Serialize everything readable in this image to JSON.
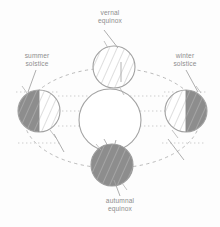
{
  "diagram": {
    "labels": {
      "vernal_equinox": {
        "line1": "vernal",
        "line2": "equinox"
      },
      "summer_solstice": {
        "line1": "summer",
        "line2": "solstice"
      },
      "winter_solstice": {
        "line1": "winter",
        "line2": "solstice"
      },
      "autumnal_equinox": {
        "line1": "autumnal",
        "line2": "equinox"
      }
    },
    "colors": {
      "stroke": "#9a9a9a",
      "shadow_fill": "#8a8a8a",
      "light_fill": "#ffffff",
      "hatch": "#b3b3b3",
      "label_text": "#8d8d8d",
      "orbit_dash": "#b0b0b0",
      "ray_dot": "#bdbdbd",
      "background": "#fdfdfd"
    },
    "sun": {
      "label": "sun",
      "cx": 110,
      "cy": 120,
      "r": 31
    },
    "earth_positions": [
      {
        "name": "vernal-equinox-earth",
        "cx": 114,
        "cy": 67,
        "r": 21,
        "shaded_side": "none",
        "description": "equinox position, terminator perpendicular to view"
      },
      {
        "name": "summer-solstice-earth",
        "cx": 39,
        "cy": 111,
        "r": 21,
        "shaded_side": "left",
        "description": "northern hemisphere tilted toward sun"
      },
      {
        "name": "winter-solstice-earth",
        "cx": 186,
        "cy": 111,
        "r": 21,
        "shaded_side": "right",
        "description": "northern hemisphere tilted away from sun"
      },
      {
        "name": "autumnal-equinox-earth",
        "cx": 112,
        "cy": 165,
        "r": 21,
        "shaded_side": "all",
        "description": "equinox position, fully shaded view"
      }
    ],
    "orbit": {
      "name": "orbital-path",
      "cx": 112,
      "cy": 118,
      "rx": 88,
      "ry": 50,
      "style": "dashed ellipse"
    },
    "sun_rays": {
      "style": "dotted horizontal lines",
      "count": 6
    }
  }
}
